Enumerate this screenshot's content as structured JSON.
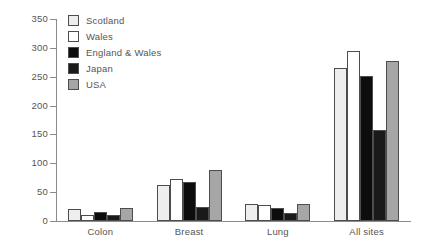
{
  "chart_data": {
    "type": "bar",
    "title": "",
    "xlabel": "",
    "ylabel": "",
    "ylim": [
      0,
      350
    ],
    "ytick_step": 50,
    "ytick_labels": [
      "350",
      "300",
      "250",
      "200",
      "150",
      "100",
      "50",
      "0"
    ],
    "ytick_values": [
      350,
      300,
      250,
      200,
      150,
      100,
      50,
      0
    ],
    "grid": false,
    "legend_position": "top-left",
    "categories": [
      "Colon",
      "Breast",
      "Lung",
      "All sites"
    ],
    "series": [
      {
        "name": "Scotland",
        "color": "#eeeeee",
        "values": [
          20,
          62,
          30,
          265
        ]
      },
      {
        "name": "Wales",
        "color": "#ffffff",
        "values": [
          10,
          72,
          28,
          295
        ]
      },
      {
        "name": "England & Wales",
        "color": "#0d0d0d",
        "values": [
          16,
          68,
          22,
          252
        ]
      },
      {
        "name": "Japan",
        "color": "#1a1a1a",
        "values": [
          11,
          25,
          14,
          157
        ]
      },
      {
        "name": "USA",
        "color": "#a6a6a6",
        "values": [
          23,
          88,
          30,
          277
        ]
      }
    ]
  },
  "legend": {
    "items": [
      {
        "label": "Scotland"
      },
      {
        "label": "Wales"
      },
      {
        "label": "England & Wales"
      },
      {
        "label": "Japan"
      },
      {
        "label": "USA"
      }
    ]
  }
}
